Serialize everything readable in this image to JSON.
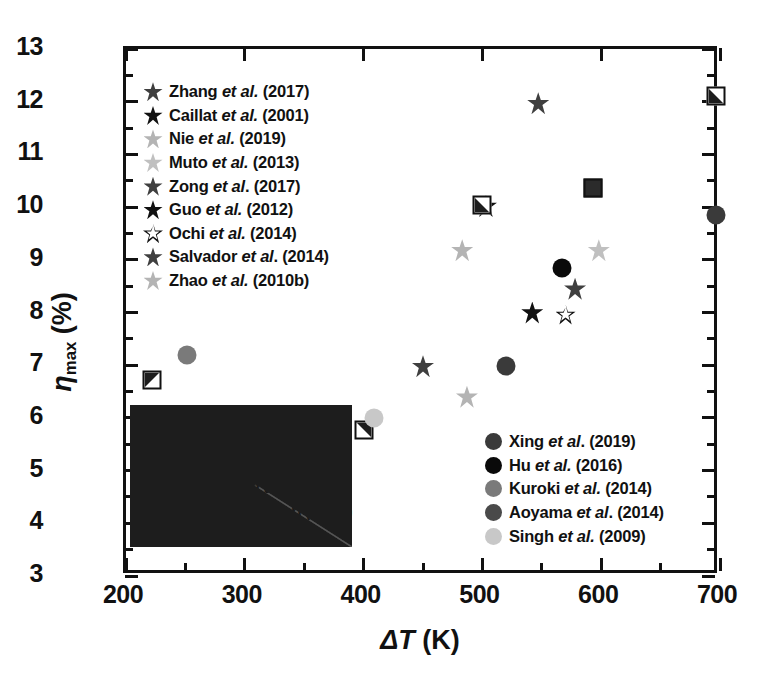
{
  "chart_data": {
    "type": "scatter",
    "title": "",
    "xlabel": "ΔT (K)",
    "ylabel": "ηmax (%)",
    "xlim": [
      200,
      700
    ],
    "ylim": [
      3,
      13
    ],
    "xticks": [
      200,
      300,
      400,
      500,
      600,
      700
    ],
    "yticks": [
      3,
      4,
      5,
      6,
      7,
      8,
      9,
      10,
      11,
      12,
      13
    ],
    "x_minor_step": 50,
    "y_minor_step": 0.5,
    "grid": false,
    "legend_position": "inside",
    "series": [
      {
        "name": "Zhang et al. (2017)",
        "marker": "star",
        "color": "#3f3f3f",
        "points": [
          [
            547,
            11.97
          ]
        ]
      },
      {
        "name": "Caillat et al. (2001)",
        "marker": "star",
        "color": "#111111",
        "points": [
          [
            542,
            8.0
          ]
        ]
      },
      {
        "name": "Nie et al. (2019)",
        "marker": "star",
        "color": "#b4b4b4",
        "points": [
          [
            483,
            9.18
          ]
        ]
      },
      {
        "name": "Muto et al. (2013)",
        "marker": "star",
        "color": "#c0c0c0",
        "points": [
          [
            598,
            9.18
          ]
        ]
      },
      {
        "name": "Zong et al. (2017)",
        "marker": "star",
        "color": "#3f3f3f",
        "points": [
          [
            450,
            6.98
          ]
        ]
      },
      {
        "name": "Guo et al. (2012)",
        "marker": "star",
        "color": "#111111",
        "points": [
          [
            503,
            10.02
          ]
        ]
      },
      {
        "name": "Ochi et al. (2014)",
        "marker": "star-open",
        "color": "#111111",
        "points": [
          [
            570,
            7.96
          ]
        ]
      },
      {
        "name": "Salvador et al. (2014)",
        "marker": "star",
        "color": "#3f3f3f",
        "points": [
          [
            578,
            8.45
          ]
        ]
      },
      {
        "name": "Zhao et al. (2010b)",
        "marker": "star",
        "color": "#b4b4b4",
        "points": [
          [
            487,
            6.4
          ]
        ]
      },
      {
        "name": "Xing et al. (2019)",
        "marker": "square-bl",
        "color": "#1d1d1d",
        "points": [
          [
            500,
            10.04
          ],
          [
            697,
            12.47
          ]
        ]
      },
      {
        "name": "Hu et al. (2016)",
        "marker": "square-solid",
        "color": "#2b2b2b",
        "points": [
          [
            593,
            11.08
          ]
        ]
      },
      {
        "name": "Crane et al. (2009)",
        "marker": "square-tl",
        "color": "#1d1d1d",
        "points": [
          [
            222,
            7.8
          ]
        ]
      },
      {
        "name": "Anatychuk et al. (2011)",
        "marker": "square-tr",
        "color": "#1d1d1d",
        "points": [
          [
            400,
            7.22
          ]
        ]
      },
      {
        "name": "Koumoto and Mori (2013)",
        "marker": "square-kou",
        "color": "#1d1d1d",
        "points": []
      },
      {
        "name": "D’Angelo et al. (2011)",
        "marker": "square-open",
        "color": "#111111",
        "points": [
          [
            379,
            6.55
          ]
        ]
      },
      {
        "name": "Xing et al. (2019)",
        "marker": "circle",
        "color": "#3a3a3a",
        "points": [
          [
            520,
            6.98
          ],
          [
            697,
            9.85
          ]
        ]
      },
      {
        "name": "Hu et al. (2016)",
        "marker": "circle",
        "color": "#0a0a0a",
        "points": [
          [
            567,
            8.85
          ]
        ]
      },
      {
        "name": "Kuroki et al. (2014)",
        "marker": "circle",
        "color": "#7a7a7a",
        "points": [
          [
            251,
            7.2
          ]
        ]
      },
      {
        "name": "Aoyama et al. (2014)",
        "marker": "circle",
        "color": "#4a4a4a",
        "points": []
      },
      {
        "name": "Singh et al. (2009)",
        "marker": "circle",
        "color": "#c8c8c8",
        "points": [
          [
            409,
            6.0
          ]
        ]
      }
    ]
  },
  "axes": {
    "x_title_delta": "ΔT",
    "x_title_unit": " (K)",
    "y_title_eta": "η",
    "y_title_sub": "max",
    "y_title_unit": " (%)",
    "xticklabels": [
      "200",
      "300",
      "400",
      "500",
      "600",
      "700"
    ],
    "yticklabels": [
      "3",
      "4",
      "5",
      "6",
      "7",
      "8",
      "9",
      "10",
      "11",
      "12",
      "13"
    ]
  },
  "legend_stars": {
    "items": [
      {
        "label_name": "Zhang",
        "label_it": "et al.",
        "label_year": " (2017)",
        "marker": "star",
        "color": "#3f3f3f"
      },
      {
        "label_name": "Caillat",
        "label_it": "et al.",
        "label_year": " (2001)",
        "marker": "star",
        "color": "#111111"
      },
      {
        "label_name": "Nie",
        "label_it": "et al.",
        "label_year": " (2019)",
        "marker": "star",
        "color": "#b4b4b4"
      },
      {
        "label_name": "Muto",
        "label_it": "et al.",
        "label_year": " (2013)",
        "marker": "star",
        "color": "#c0c0c0"
      },
      {
        "label_name": "Zong",
        "label_it": "et al",
        "label_year": ". (2017)",
        "marker": "star",
        "color": "#3f3f3f"
      },
      {
        "label_name": "Guo",
        "label_it": "et al.",
        "label_year": " (2012)",
        "marker": "star",
        "color": "#111111"
      },
      {
        "label_name": "Ochi",
        "label_it": "et al.",
        "label_year": " (2014)",
        "marker": "star-open",
        "color": "#111111"
      },
      {
        "label_name": "Salvador",
        "label_it": "et al",
        "label_year": ". (2014)",
        "marker": "star",
        "color": "#3f3f3f"
      },
      {
        "label_name": "Zhao",
        "label_it": "et al.",
        "label_year": " (2010b)",
        "marker": "star",
        "color": "#b4b4b4"
      }
    ]
  },
  "legend_squares": {
    "items": [
      {
        "label_name": "Xing",
        "label_it": "et al.",
        "label_year": " (2019)",
        "marker": "square-bl"
      },
      {
        "label_name": "Hu",
        "label_it": "et al.",
        "label_year": " (2016)",
        "marker": "square-solid"
      },
      {
        "label_name": "Crane",
        "label_it": "et al.",
        "label_year": " (2009)",
        "marker": "square-tl"
      },
      {
        "label_name": "Anatychuk",
        "label_it": "et al.",
        "label_year": " (2011)",
        "marker": "square-tr"
      },
      {
        "label_name": "Koumoto and Mori",
        "label_it": "(",
        "label_year": "2013)",
        "marker": "square-kou"
      },
      {
        "label_name": "D’Angelo",
        "label_it": "et al",
        "label_year": ". (2011)",
        "marker": "square-open"
      }
    ]
  },
  "legend_circles": {
    "items": [
      {
        "label_name": "Xing",
        "label_it": "et al",
        "label_year": ". (2019)",
        "marker": "circle",
        "color": "#3a3a3a"
      },
      {
        "label_name": "Hu",
        "label_it": "et al.",
        "label_year": " (2016)",
        "marker": "circle",
        "color": "#0a0a0a"
      },
      {
        "label_name": "Kuroki",
        "label_it": "et al.",
        "label_year": " (2014)",
        "marker": "circle",
        "color": "#7a7a7a"
      },
      {
        "label_name": "Aoyama",
        "label_it": "et al",
        "label_year": ". (2014)",
        "marker": "circle",
        "color": "#4a4a4a"
      },
      {
        "label_name": "Singh",
        "label_it": "et al.",
        "label_year": " (2009)",
        "marker": "circle",
        "color": "#c8c8c8"
      }
    ]
  }
}
